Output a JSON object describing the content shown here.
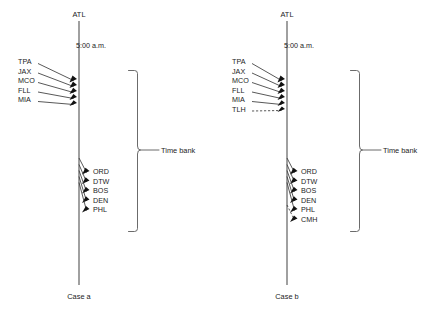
{
  "figure": {
    "hub_code": "ATL",
    "time_marker": "5:00 a.m.",
    "time_bank_label": "Time bank"
  },
  "panels": [
    {
      "id": "case-a",
      "caption": "Case a",
      "hub_code": "ATL",
      "time_marker": "5:00 a.m.",
      "time_bank_label": "Time bank",
      "inbound": [
        {
          "code": "TPA",
          "dashed": false
        },
        {
          "code": "JAX",
          "dashed": false
        },
        {
          "code": "MCO",
          "dashed": false
        },
        {
          "code": "FLL",
          "dashed": false
        },
        {
          "code": "MIA",
          "dashed": false
        }
      ],
      "outbound": [
        {
          "code": "ORD",
          "dashed": false
        },
        {
          "code": "DTW",
          "dashed": false
        },
        {
          "code": "BOS",
          "dashed": false
        },
        {
          "code": "DEN",
          "dashed": false
        },
        {
          "code": "PHL",
          "dashed": false
        }
      ]
    },
    {
      "id": "case-b",
      "caption": "Case b",
      "hub_code": "ATL",
      "time_marker": "5:00 a.m.",
      "time_bank_label": "Time bank",
      "inbound": [
        {
          "code": "TPA",
          "dashed": false
        },
        {
          "code": "JAX",
          "dashed": false
        },
        {
          "code": "MCO",
          "dashed": false
        },
        {
          "code": "FLL",
          "dashed": false
        },
        {
          "code": "MIA",
          "dashed": false
        },
        {
          "code": "TLH",
          "dashed": true
        }
      ],
      "outbound": [
        {
          "code": "ORD",
          "dashed": false
        },
        {
          "code": "DTW",
          "dashed": false
        },
        {
          "code": "BOS",
          "dashed": false
        },
        {
          "code": "DEN",
          "dashed": false
        },
        {
          "code": "PHL",
          "dashed": false
        },
        {
          "code": "CMH",
          "dashed": true
        }
      ]
    }
  ],
  "colors": {
    "line": "#3a3a3a",
    "axis": "#4a4a4a",
    "arrow": "#111111",
    "bracket": "#5a5a5a",
    "text": "#1c1c1c",
    "background": "#ffffff"
  }
}
